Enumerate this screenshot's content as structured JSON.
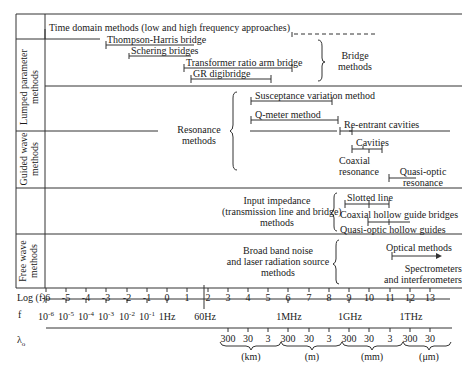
{
  "categories": {
    "lumped": "Lumped parameter methods",
    "lumped_l1": "Lumped parameter",
    "lumped_l2": "methods",
    "guided_l1": "Guided wave",
    "guided_l2": "methods",
    "free_l1": "Free wave",
    "free_l2": "methods"
  },
  "lumped": {
    "time_domain": "Time domain methods (low and high frequency approaches)",
    "thompson": "Thompson-Harris bridge",
    "schering": "Schering bridges",
    "transformer": "Transformer ratio arm bridge",
    "gr": "GR digibridge",
    "bridge_l1": "Bridge",
    "bridge_l2": "methods"
  },
  "resonance": {
    "group_l1": "Resonance",
    "group_l2": "methods",
    "susceptance": "Susceptance variation method",
    "qmeter": "Q-meter method",
    "reentrant": "Re-entrant cavities",
    "cavities": "Cavities",
    "coaxial_l1": "Coaxial",
    "coaxial_l2": "resonance",
    "quasi_l1": "Quasi-optic",
    "quasi_l2": "resonance"
  },
  "guided": {
    "group_l1": "Input impedance",
    "group_l2": "(transmission line and bridge)",
    "group_l3": "methods",
    "slotted": "Slotted line",
    "coaxial_hollow": "Coaxial hollow guide bridges",
    "quasi_hollow": "Quasi-optic hollow guides"
  },
  "free": {
    "group_l1": "Broad band noise",
    "group_l2": "and laser radiation source",
    "group_l3": "methods",
    "optical": "Optical methods",
    "spectro_l1": "Spectrometers",
    "spectro_l2": "and interferometers"
  },
  "axes": {
    "log_label": "Log (f)",
    "log_ticks": [
      "-6",
      "-5",
      "-4",
      "-3",
      "-2",
      "-1",
      "0",
      "1",
      "2",
      "3",
      "4",
      "5",
      "6",
      "7",
      "8",
      "9",
      "10",
      "11",
      "12",
      "13"
    ],
    "f_label": "f",
    "f_ticks": [
      {
        "base": "10",
        "exp": "-6"
      },
      {
        "base": "10",
        "exp": "-5"
      },
      {
        "base": "10",
        "exp": "-4"
      },
      {
        "base": "10",
        "exp": "-3"
      },
      {
        "base": "10",
        "exp": "-2"
      },
      {
        "base": "10",
        "exp": "-1"
      }
    ],
    "f_1hz": "1Hz",
    "f_60hz": "60Hz",
    "f_1mhz": "1MHz",
    "f_1ghz": "1GHz",
    "f_1thz": "1THz",
    "lambda_label": "λ",
    "lambda_sub": "o",
    "lambda_groups": [
      {
        "values": [
          "300",
          "30",
          "3"
        ],
        "unit": "(km)"
      },
      {
        "values": [
          "300",
          "30",
          "3"
        ],
        "unit": "(m)"
      },
      {
        "values": [
          "300",
          "30",
          "3"
        ],
        "unit": "(mm)"
      },
      {
        "values": [
          "300",
          "30"
        ],
        "unit": "(μm)"
      }
    ]
  }
}
